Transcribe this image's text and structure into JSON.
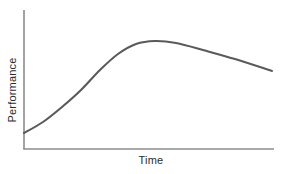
{
  "chart": {
    "ylabel": "Performance",
    "xlabel": "Time"
  },
  "chart_data": {
    "type": "line",
    "title": "",
    "xlabel": "Time",
    "ylabel": "Performance",
    "axis_tick_labels": "none",
    "gridlines": false,
    "legend": "none",
    "series": [
      {
        "name": "performance-curve",
        "points_px": [
          [
            24,
            133
          ],
          [
            43,
            122
          ],
          [
            62,
            107
          ],
          [
            81,
            90
          ],
          [
            100,
            70
          ],
          [
            118,
            54
          ],
          [
            136,
            44
          ],
          [
            155,
            41
          ],
          [
            176,
            43
          ],
          [
            203,
            50
          ],
          [
            235,
            59
          ],
          [
            272,
            71
          ]
        ],
        "points_normalized_x": [
          0.0,
          0.08,
          0.15,
          0.23,
          0.31,
          0.38,
          0.45,
          0.53,
          0.61,
          0.72,
          0.85,
          1.0
        ],
        "points_normalized_y": [
          0.12,
          0.19,
          0.3,
          0.42,
          0.57,
          0.68,
          0.76,
          0.78,
          0.76,
          0.71,
          0.65,
          0.56
        ]
      }
    ],
    "plot_area_px": {
      "x_axis_y": 149,
      "y_axis_x": 24,
      "y_axis_top": 10,
      "x_axis_right": 274
    },
    "colors": {
      "curve": "#595a5c",
      "axis": "#8a8c8e",
      "label": "#2b2b2b",
      "background": "#ffffff"
    }
  }
}
